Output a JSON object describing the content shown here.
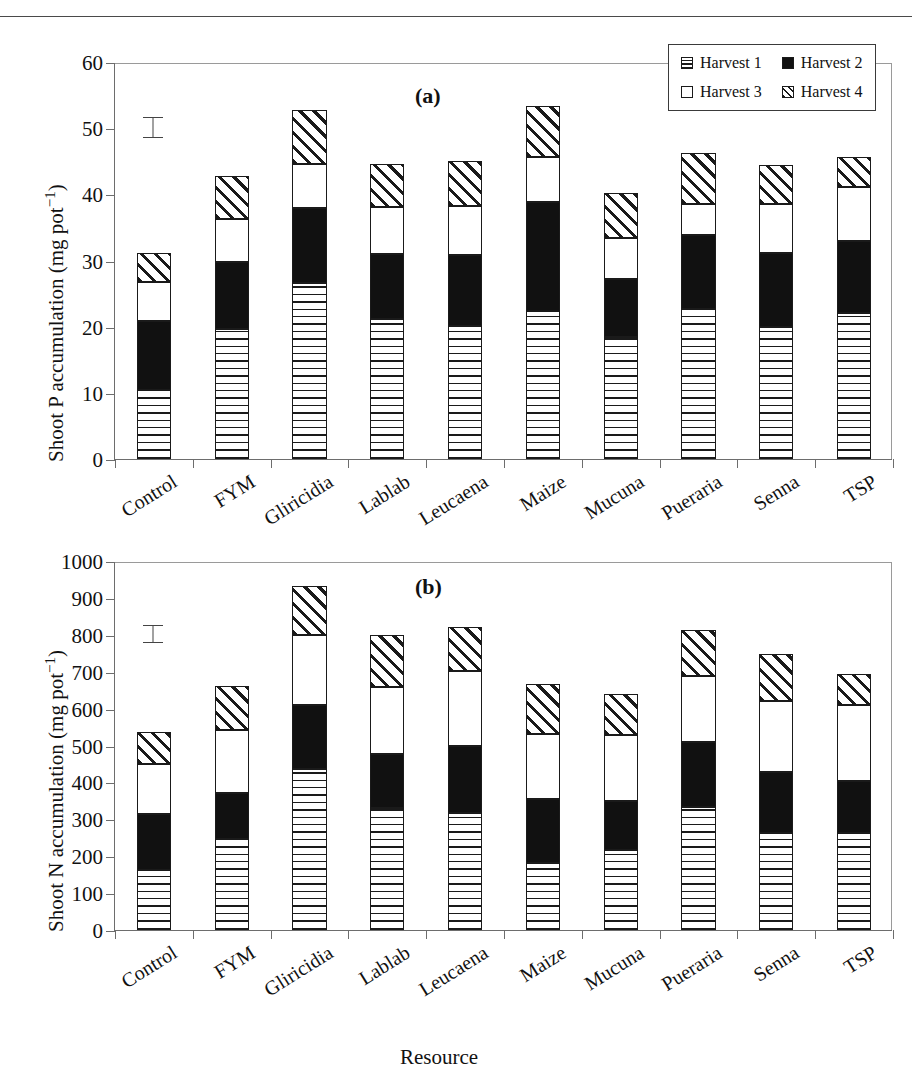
{
  "header": {
    "crumb": ""
  },
  "legend": {
    "position": "top-right",
    "items": [
      {
        "label": "Harvest 1",
        "pattern": "horizontal-hatch"
      },
      {
        "label": "Harvest 2",
        "pattern": "solid-black"
      },
      {
        "label": "Harvest 3",
        "pattern": "open-white"
      },
      {
        "label": "Harvest 4",
        "pattern": "diagonal-hatch"
      }
    ]
  },
  "axis": {
    "xlabel": "Resource"
  },
  "panels": [
    {
      "tag": "(a)",
      "ylabel_main": "Shoot P accumulation (mg pot",
      "ylabel_sup": "−1",
      "ylabel_tail": ")"
    },
    {
      "tag": "(b)",
      "ylabel_main": "Shoot N accumulation (mg pot",
      "ylabel_sup": "−1",
      "ylabel_tail": ")"
    }
  ],
  "chart_data": [
    {
      "type": "bar",
      "subtype": "stacked",
      "title": "(a)",
      "xlabel": "Resource",
      "ylabel": "Shoot P accumulation (mg pot⁻¹)",
      "ylim": [
        0,
        60
      ],
      "yticks": [
        0,
        10,
        20,
        30,
        40,
        50,
        60
      ],
      "grid": false,
      "legend_position": "top-right",
      "categories": [
        "Control",
        "FYM",
        "Gliricidia",
        "Lablab",
        "Leucaena",
        "Maize",
        "Mucuna",
        "Pueraria",
        "Senna",
        "TSP"
      ],
      "series": [
        {
          "name": "Harvest 1",
          "pattern": "horizontal-hatch",
          "values": [
            10.5,
            19.7,
            26.6,
            21.2,
            20.1,
            22.3,
            18.5,
            22.6,
            19.9,
            22.1
          ]
        },
        {
          "name": "Harvest 2",
          "pattern": "solid-black",
          "values": [
            10.3,
            10.1,
            11.4,
            9.8,
            10.7,
            16.6,
            8.7,
            11.2,
            11.2,
            10.8
          ]
        },
        {
          "name": "Harvest 3",
          "pattern": "open-white",
          "values": [
            6.0,
            6.4,
            6.6,
            7.1,
            7.4,
            6.7,
            6.2,
            4.8,
            7.5,
            8.2
          ]
        },
        {
          "name": "Harvest 4",
          "pattern": "diagonal-hatch",
          "values": [
            4.3,
            6.6,
            8.1,
            6.5,
            6.8,
            7.8,
            6.8,
            7.7,
            5.8,
            4.6
          ]
        }
      ],
      "totals": [
        31.1,
        42.8,
        52.7,
        44.6,
        45.0,
        53.4,
        40.2,
        46.3,
        44.4,
        45.7
      ],
      "error_bar": {
        "label": "LSD",
        "center_value": 50.2,
        "half_width": 1.6,
        "at_category_gap": "between Control and FYM"
      }
    },
    {
      "type": "bar",
      "subtype": "stacked",
      "title": "(b)",
      "xlabel": "Resource",
      "ylabel": "Shoot N accumulation (mg pot⁻¹)",
      "ylim": [
        0,
        1000
      ],
      "yticks": [
        0,
        100,
        200,
        300,
        400,
        500,
        600,
        700,
        800,
        900,
        1000
      ],
      "grid": false,
      "legend_position": "none",
      "categories": [
        "Control",
        "FYM",
        "Gliricidia",
        "Lablab",
        "Leucaena",
        "Maize",
        "Mucuna",
        "Pueraria",
        "Senna",
        "TSP"
      ],
      "series": [
        {
          "name": "Harvest 1",
          "pattern": "horizontal-hatch",
          "values": [
            163,
            247,
            436,
            330,
            318,
            181,
            217,
            333,
            263,
            263
          ]
        },
        {
          "name": "Harvest 2",
          "pattern": "solid-black",
          "values": [
            152,
            124,
            173,
            148,
            180,
            175,
            133,
            177,
            165,
            141
          ]
        },
        {
          "name": "Harvest 3",
          "pattern": "open-white",
          "values": [
            134,
            171,
            190,
            180,
            204,
            176,
            179,
            178,
            192,
            207
          ]
        },
        {
          "name": "Harvest 4",
          "pattern": "diagonal-hatch",
          "values": [
            88,
            118,
            134,
            142,
            120,
            135,
            112,
            124,
            128,
            82
          ]
        }
      ],
      "totals": [
        537,
        660,
        933,
        800,
        822,
        667,
        641,
        812,
        748,
        693
      ],
      "error_bar": {
        "label": "LSD",
        "center_value": 805,
        "half_width": 22,
        "at_category_gap": "between Control and FYM"
      }
    }
  ]
}
